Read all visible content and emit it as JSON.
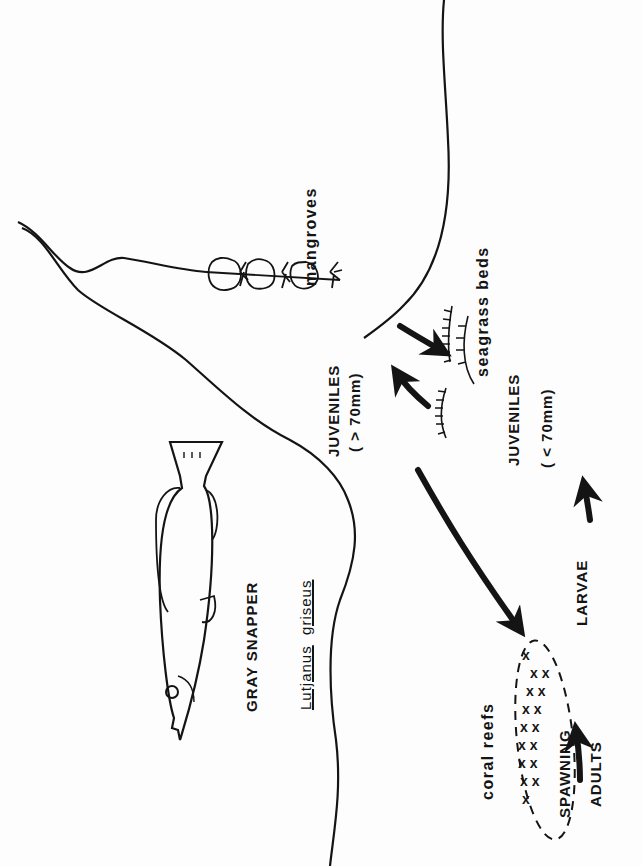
{
  "diagram": {
    "orientation": "rotated-90-counterclockwise",
    "colors": {
      "ink": "#141414",
      "paper": "#fdfdfd"
    },
    "title": {
      "common_name": "GRAY SNAPPER",
      "scientific_genus": "Lutjanus",
      "scientific_species": "griseus"
    },
    "habitats": {
      "mangroves": "mangroves",
      "seagrass": "seagrass beds",
      "coral": "coral reefs"
    },
    "life_stages": {
      "juv_large": "JUVENILES",
      "juv_large_size": "( > 70mm)",
      "juv_small": "JUVENILES",
      "juv_small_size": "( < 70mm)",
      "larvae": "LARVAE",
      "spawning": "SPAWNING",
      "adults": "ADULTS"
    },
    "flows": [
      {
        "from": "SPAWNING ADULTS",
        "to": "LARVAE"
      },
      {
        "from": "LARVAE",
        "to": "JUVENILES (< 70mm)"
      },
      {
        "from": "seagrass beds",
        "to": "JUVENILES (> 70mm)"
      },
      {
        "from": "JUVENILES (> 70mm)",
        "to": "seagrass beds"
      },
      {
        "from": "JUVENILES (> 70mm)",
        "to": "coral reefs"
      }
    ],
    "icons": [
      "fish-illustration",
      "mangrove-tree-icon",
      "seagrass-icon",
      "coral-reef-icon",
      "flow-arrow-icon"
    ]
  }
}
